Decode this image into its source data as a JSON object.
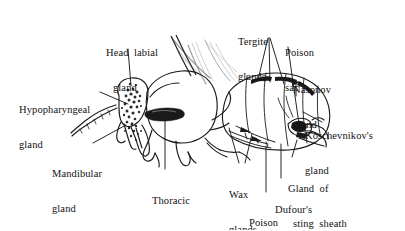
{
  "figure": {
    "background_color": "#ffffff",
    "ink_color": "#1a1a1a",
    "wing_color": "#b9b9b9",
    "width": 405,
    "height": 230
  },
  "labels": [
    {
      "id": "head-labial-gland",
      "name": "head-labial-gland-label",
      "line1": "Head  labial",
      "line2": "gland",
      "align": "left",
      "x": 106,
      "y": 24
    },
    {
      "id": "hypopharyngeal-gland",
      "name": "hypopharyngeal-gland-label",
      "line1": "Hypopharyngeal",
      "line2": "gland",
      "align": "left",
      "x": 19,
      "y": 81
    },
    {
      "id": "mandibular-gland",
      "name": "mandibular-gland-label",
      "line1": "Mandibular",
      "line2": "gland",
      "align": "left",
      "x": 52,
      "y": 145
    },
    {
      "id": "thoracic-labial-gland",
      "name": "thoracic-labial-gland-label",
      "line1": "Thoracic",
      "line2": "labial  gland",
      "align": "left",
      "x": 147,
      "y": 172
    },
    {
      "id": "tergite-glands",
      "name": "tergite-glands-label",
      "line1": "Tergite",
      "line2": "glands",
      "align": "left",
      "x": 238,
      "y": 13
    },
    {
      "id": "poison-sac",
      "name": "poison-sac-label",
      "line1": "Poison",
      "line2": "sac",
      "align": "left",
      "x": 285,
      "y": 24
    },
    {
      "id": "nasonov-gland",
      "name": "nasonov-gland-label",
      "line1": "Nasonov",
      "line2": "gland",
      "align": "left",
      "x": 293,
      "y": 61
    },
    {
      "id": "koschevnikovs-gland",
      "name": "koschevnikovs-gland-label",
      "line1": "Koschevnikov's",
      "line2": "gland",
      "align": "left",
      "x": 305,
      "y": 107
    },
    {
      "id": "wax-glands",
      "name": "wax-glands-label",
      "line1": "Wax",
      "line2": "glands",
      "align": "left",
      "x": 229,
      "y": 166
    },
    {
      "id": "poison-gland",
      "name": "poison-gland-label",
      "line1": "Poison",
      "line2": "gland",
      "align": "left",
      "x": 249,
      "y": 194
    },
    {
      "id": "dufours-gland",
      "name": "dufours-gland-label",
      "line1": "Dufour's",
      "line2": "gland",
      "align": "left",
      "x": 275,
      "y": 181
    },
    {
      "id": "gland-of-sting-sheath",
      "name": "gland-of-sting-sheath-label",
      "line1": "Gland  of",
      "line2": "sting  sheath",
      "align": "left",
      "x": 288,
      "y": 160
    }
  ],
  "anatomy_parts": [
    "head",
    "antenna",
    "mandible",
    "thorax",
    "forewing",
    "hindwing",
    "foreleg",
    "midleg",
    "hindleg",
    "abdomen",
    "sting"
  ]
}
